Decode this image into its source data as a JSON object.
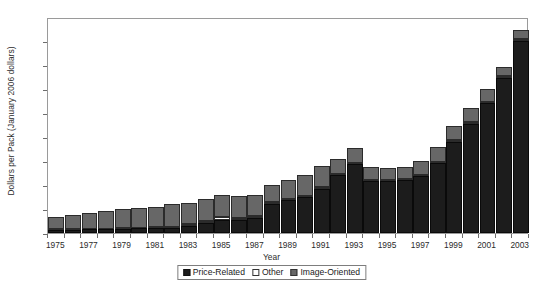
{
  "chart_data": {
    "type": "bar",
    "stacked": true,
    "title": "",
    "xlabel": "Year",
    "ylabel": "Dollars per Pack (January 2006 dollars)",
    "ylim": [
      0,
      0.9
    ],
    "ytick_labels": [
      "0.9",
      "0.8",
      "0.7",
      "0.6",
      "0.5",
      "0.4",
      "0.3",
      "0.2",
      "0.1",
      "0"
    ],
    "ytick_values": [
      0.9,
      0.8,
      0.7,
      0.6,
      0.5,
      0.4,
      0.3,
      0.2,
      0.1,
      0
    ],
    "grid": false,
    "legend_position": "bottom",
    "categories": [
      1975,
      1976,
      1977,
      1978,
      1979,
      1980,
      1981,
      1982,
      1983,
      1984,
      1985,
      1986,
      1987,
      1988,
      1989,
      1990,
      1991,
      1992,
      1993,
      1994,
      1995,
      1996,
      1997,
      1998,
      1999,
      2000,
      2001,
      2002,
      2003
    ],
    "xtick_labels": [
      "1975",
      "1977",
      "1979",
      "1981",
      "1983",
      "1985",
      "1987",
      "1989",
      "1991",
      "1993",
      "1995",
      "1997",
      "1999",
      "2001",
      "2003"
    ],
    "series": [
      {
        "name": "Price-Related",
        "color": "#1c1c1c",
        "values": [
          0.013,
          0.014,
          0.015,
          0.016,
          0.018,
          0.019,
          0.02,
          0.022,
          0.03,
          0.042,
          0.055,
          0.055,
          0.063,
          0.122,
          0.137,
          0.15,
          0.185,
          0.24,
          0.288,
          0.218,
          0.215,
          0.22,
          0.238,
          0.29,
          0.38,
          0.455,
          0.54,
          0.645,
          0.8
        ]
      },
      {
        "name": "Other",
        "color": "#ffffff",
        "values": [
          0.002,
          0.002,
          0.002,
          0.002,
          0.003,
          0.003,
          0.003,
          0.004,
          0.006,
          0.008,
          0.01,
          0.008,
          0.008,
          0.006,
          0.005,
          0.005,
          0.005,
          0.005,
          0.005,
          0.004,
          0.004,
          0.004,
          0.004,
          0.005,
          0.006,
          0.006,
          0.007,
          0.008,
          0.01
        ]
      },
      {
        "name": "Image-Oriented",
        "color": "#676767",
        "values": [
          0.05,
          0.059,
          0.068,
          0.072,
          0.079,
          0.083,
          0.087,
          0.094,
          0.089,
          0.09,
          0.095,
          0.092,
          0.089,
          0.072,
          0.078,
          0.085,
          0.09,
          0.065,
          0.062,
          0.053,
          0.051,
          0.051,
          0.058,
          0.065,
          0.059,
          0.059,
          0.053,
          0.037,
          0.035
        ]
      }
    ],
    "totals": [
      0.065,
      0.075,
      0.085,
      0.09,
      0.1,
      0.105,
      0.11,
      0.12,
      0.125,
      0.14,
      0.16,
      0.155,
      0.16,
      0.2,
      0.22,
      0.24,
      0.28,
      0.31,
      0.355,
      0.275,
      0.27,
      0.275,
      0.3,
      0.36,
      0.445,
      0.52,
      0.6,
      0.69,
      0.845
    ]
  },
  "legend": {
    "items": [
      {
        "label": "Price-Related"
      },
      {
        "label": "Other"
      },
      {
        "label": "Image-Oriented"
      }
    ]
  }
}
